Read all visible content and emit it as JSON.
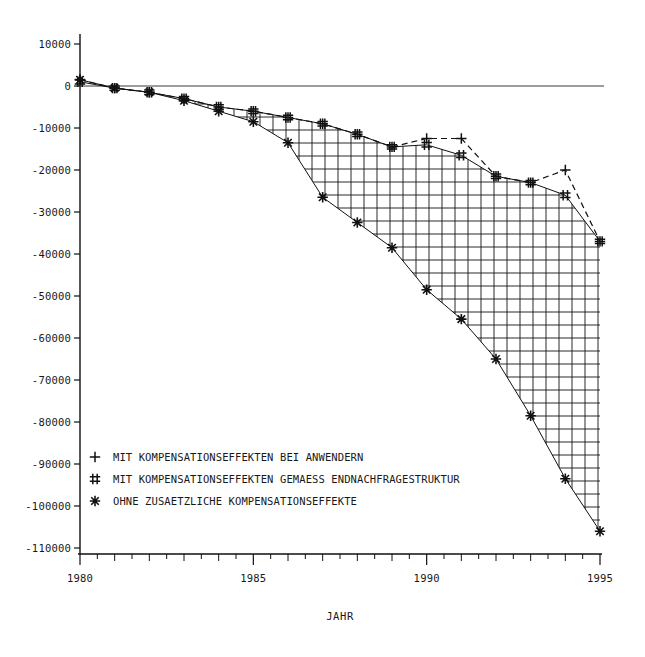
{
  "chart_data": {
    "type": "line",
    "title": "",
    "xlabel": "JAHR",
    "ylabel": "",
    "x": [
      1980,
      1981,
      1982,
      1983,
      1984,
      1985,
      1986,
      1987,
      1988,
      1989,
      1990,
      1991,
      1992,
      1993,
      1994,
      1995
    ],
    "xlim": [
      1980,
      1995
    ],
    "ylim": [
      -110000,
      10000
    ],
    "grid": false,
    "legend_position": "lower-left-inside",
    "x_major_ticks": [
      1980,
      1985,
      1990,
      1995
    ],
    "x_major_tick_labels": [
      "1980",
      "1985",
      "1990",
      "1995"
    ],
    "x_minor_ticks": [
      1981,
      1982,
      1983,
      1984,
      1986,
      1987,
      1988,
      1989,
      1991,
      1992,
      1993,
      1994
    ],
    "y_ticks": [
      10000,
      0,
      -10000,
      -20000,
      -30000,
      -40000,
      -50000,
      -60000,
      -70000,
      -80000,
      -90000,
      -100000,
      -110000
    ],
    "y_tick_labels": [
      "10000",
      "0",
      "-10000",
      "-20000",
      "-30000",
      "-40000",
      "-50000",
      "-60000",
      "-70000",
      "-80000",
      "-90000",
      "-100000",
      "-110000"
    ],
    "series": [
      {
        "name": "MIT KOMPENSATIONSEFFEKTEN BEI ANWENDERN",
        "marker": "+",
        "linestyle": "dashed",
        "values": [
          1500,
          -500,
          -1500,
          -3000,
          -5000,
          -6000,
          -7500,
          -9000,
          -11500,
          -14500,
          -12500,
          -12500,
          -21500,
          -23000,
          -20000,
          -37000
        ]
      },
      {
        "name": "MIT KOMPENSATIONSEFFEKTEN GEMAESS ENDNACHFRAGESTRUKTUR",
        "marker": "#",
        "linestyle": "solid",
        "values": [
          1000,
          -500,
          -1500,
          -3000,
          -5000,
          -6000,
          -7500,
          -9000,
          -11500,
          -14500,
          -14000,
          -16500,
          -21500,
          -23000,
          -26000,
          -37000
        ]
      },
      {
        "name": "OHNE ZUSAETZLICHE KOMPENSATIONSEFFEKTE",
        "marker": "*",
        "linestyle": "solid",
        "values": [
          1500,
          -500,
          -1500,
          -3500,
          -6000,
          -8500,
          -13500,
          -26500,
          -32500,
          -38500,
          -48500,
          -55500,
          -65000,
          -78500,
          -93500,
          -106000
        ]
      }
    ],
    "shaded_region": {
      "between": [
        "MIT KOMPENSATIONSEFFEKTEN GEMAESS ENDNACHFRAGESTRUKTUR",
        "OHNE ZUSAETZLICHE KOMPENSATIONSEFFEKTE"
      ],
      "pattern": "crosshatch"
    }
  },
  "legend": {
    "entries": [
      {
        "symbol": "+",
        "label": "MIT KOMPENSATIONSEFFEKTEN BEI ANWENDERN"
      },
      {
        "symbol": "#",
        "label": "MIT KOMPENSATIONSEFFEKTEN GEMAESS ENDNACHFRAGESTRUKTUR"
      },
      {
        "symbol": "*",
        "label": "OHNE ZUSAETZLICHE KOMPENSATIONSEFFEKTE"
      }
    ]
  },
  "colors": {
    "ink": "#111111",
    "background": "#ffffff",
    "zero_line": "#3a3a3a"
  }
}
